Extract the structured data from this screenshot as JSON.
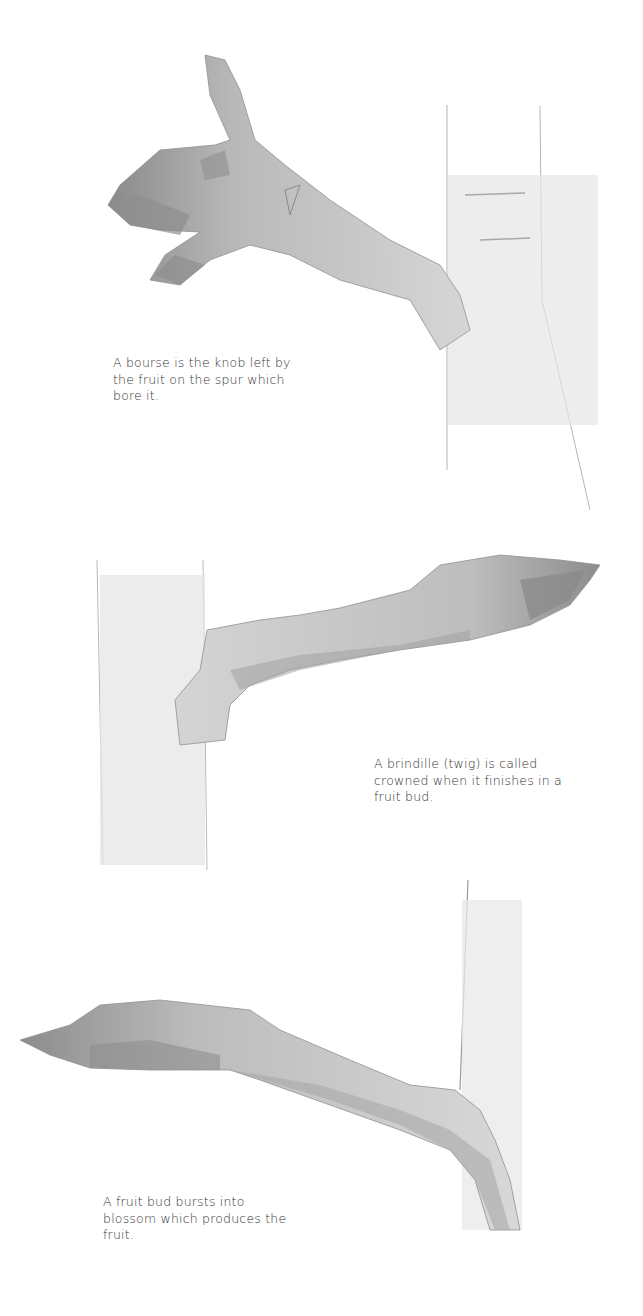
{
  "figures": [
    {
      "subject": "bourse",
      "caption_lines": [
        "A bourse is the knob left by",
        "the fruit on the spur which",
        "bore it."
      ]
    },
    {
      "subject": "crowned brindille",
      "caption_lines": [
        "A brindille (twig) is called",
        "crowned when it finishes in a",
        "fruit bud."
      ]
    },
    {
      "subject": "fruit bud",
      "caption_lines": [
        "A fruit bud bursts into",
        "blossom which produces the",
        "fruit."
      ]
    }
  ],
  "colors": {
    "background": "#ffffff",
    "wash_light": "#e2e2e2",
    "wash_mid": "#c4c4c4",
    "wash_dark": "#8f8f8f",
    "pencil": "#9a9a9a",
    "text": "#333333"
  }
}
